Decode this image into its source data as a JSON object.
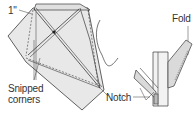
{
  "diagram": {
    "labels": {
      "measure": "1\"",
      "snipped_line1": "Snipped",
      "snipped_line2": "corners",
      "notch": "Notch",
      "fold": "Fold"
    },
    "colors": {
      "line": "#3a3a3a",
      "fill": "#e6e6e6",
      "fill_dark": "#d4d4d4",
      "background": "#ffffff"
    }
  }
}
